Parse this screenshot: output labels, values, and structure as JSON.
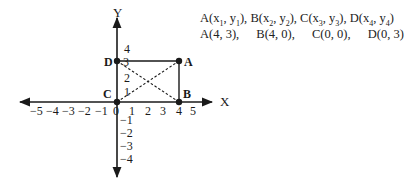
{
  "diagram": {
    "type": "coordinate-plane",
    "x_axis_label": "X",
    "y_axis_label": "Y",
    "origin_label": "0",
    "x_ticks": [
      "−5",
      "−4",
      "−3",
      "−2",
      "−1",
      "1",
      "2",
      "3",
      "4",
      "5"
    ],
    "y_ticks_positive": [
      "1",
      "2",
      "3",
      "4"
    ],
    "y_ticks_negative": [
      "−1",
      "−2",
      "−3",
      "−4"
    ],
    "points": [
      {
        "name": "A",
        "x": 4,
        "y": 3
      },
      {
        "name": "B",
        "x": 4,
        "y": 0
      },
      {
        "name": "C",
        "x": 0,
        "y": 0
      },
      {
        "name": "D",
        "x": 0,
        "y": 3
      }
    ],
    "rectangle": [
      "A",
      "B",
      "C",
      "D"
    ],
    "diagonals": [
      "AC",
      "BD"
    ]
  },
  "info": {
    "general": [
      {
        "pt": "A",
        "x": "x",
        "xs": "1",
        "y": "y",
        "ys": "1"
      },
      {
        "pt": "B",
        "x": "x",
        "xs": "2",
        "y": "y",
        "ys": "2"
      },
      {
        "pt": "C",
        "x": "x",
        "xs": "3",
        "y": "y",
        "ys": "3"
      },
      {
        "pt": "D",
        "x": "x",
        "xs": "4",
        "y": "y",
        "ys": "4"
      }
    ],
    "specific": [
      "A(4, 3),",
      "B(4, 0),",
      "C(0, 0),",
      "D(0, 3)"
    ]
  }
}
